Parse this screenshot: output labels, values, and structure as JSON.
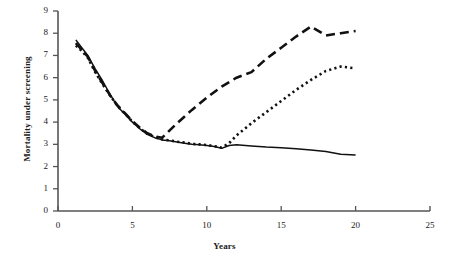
{
  "chart_data": {
    "type": "line",
    "title": "",
    "xlabel": "Years",
    "ylabel": "Mortality under screening",
    "xlim": [
      0,
      25
    ],
    "ylim": [
      0,
      9
    ],
    "xticks": [
      0,
      5,
      10,
      15,
      20,
      25
    ],
    "yticks": [
      0,
      1,
      2,
      3,
      4,
      5,
      6,
      7,
      8,
      9
    ],
    "grid": false,
    "legend": "none",
    "axis_color": "#555555",
    "line_color": "#111111",
    "series": [
      {
        "name": "solid-line",
        "style": "solid",
        "x": [
          1.2,
          1.6,
          2.0,
          2.5,
          3.0,
          3.5,
          4.0,
          4.5,
          5.0,
          5.5,
          6.0,
          6.5,
          7.0,
          7.5,
          8.0,
          8.5,
          9.0,
          9.5,
          10.0,
          10.5,
          11.0,
          11.5,
          12.0,
          13.0,
          14.0,
          15.0,
          16.0,
          17.0,
          18.0,
          19.0,
          20.0
        ],
        "y": [
          7.7,
          7.35,
          7.0,
          6.4,
          5.85,
          5.25,
          4.7,
          4.35,
          4.0,
          3.7,
          3.45,
          3.3,
          3.2,
          3.16,
          3.1,
          3.05,
          3.0,
          2.98,
          2.95,
          2.9,
          2.82,
          2.95,
          2.98,
          2.93,
          2.88,
          2.85,
          2.8,
          2.75,
          2.68,
          2.55,
          2.52
        ]
      },
      {
        "name": "dashed-line",
        "style": "dashed",
        "x": [
          1.2,
          1.6,
          2.0,
          2.5,
          3.0,
          3.5,
          4.0,
          4.5,
          5.0,
          5.5,
          6.0,
          6.5,
          7.0,
          8.0,
          9.0,
          10.0,
          11.0,
          12.0,
          13.0,
          14.0,
          15.0,
          16.0,
          17.0,
          18.0,
          19.0,
          20.0
        ],
        "y": [
          7.55,
          7.25,
          6.95,
          6.3,
          5.75,
          5.2,
          4.75,
          4.4,
          4.05,
          3.75,
          3.5,
          3.35,
          3.3,
          3.95,
          4.55,
          5.1,
          5.6,
          6.0,
          6.25,
          6.85,
          7.35,
          7.85,
          8.3,
          7.9,
          8.0,
          8.1
        ]
      },
      {
        "name": "dotted-line",
        "style": "dotted",
        "x": [
          1.2,
          1.6,
          2.0,
          2.5,
          3.0,
          3.5,
          4.0,
          4.5,
          5.0,
          5.5,
          6.0,
          6.5,
          7.0,
          7.5,
          8.0,
          8.5,
          9.0,
          9.5,
          10.0,
          10.5,
          11.0,
          11.5,
          12.0,
          13.0,
          14.0,
          15.0,
          16.0,
          17.0,
          18.0,
          19.0,
          20.0
        ],
        "y": [
          7.45,
          7.2,
          6.9,
          6.25,
          5.7,
          5.2,
          4.72,
          4.38,
          4.02,
          3.72,
          3.48,
          3.32,
          3.22,
          3.18,
          3.12,
          3.08,
          3.02,
          3.0,
          2.97,
          2.92,
          2.85,
          3.05,
          3.4,
          3.95,
          4.45,
          4.95,
          5.45,
          5.9,
          6.3,
          6.5,
          6.42
        ]
      }
    ]
  }
}
